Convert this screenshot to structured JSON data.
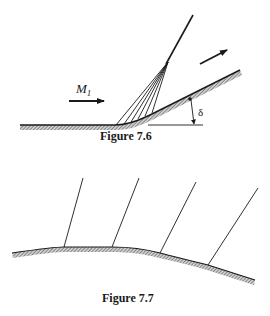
{
  "figures": [
    {
      "id": "fig-7-6",
      "caption": "Figure 7.6",
      "labels": {
        "mach": "M",
        "mach_subscript": "1",
        "angle": "δ"
      },
      "description": "Prandtl-Meyer expansion fan around a smooth convex corner turning the flow by angle delta; expansion waves coalesce into a single line above the wall"
    },
    {
      "id": "fig-7-7",
      "caption": "Figure 7.7",
      "labels": {},
      "description": "Curved convex wall with four Mach lines (expansion waves) emanating from points along the surface"
    }
  ],
  "colors": {
    "ink": "#1a1a1a",
    "hatch": "#555555",
    "background": "#ffffff"
  }
}
